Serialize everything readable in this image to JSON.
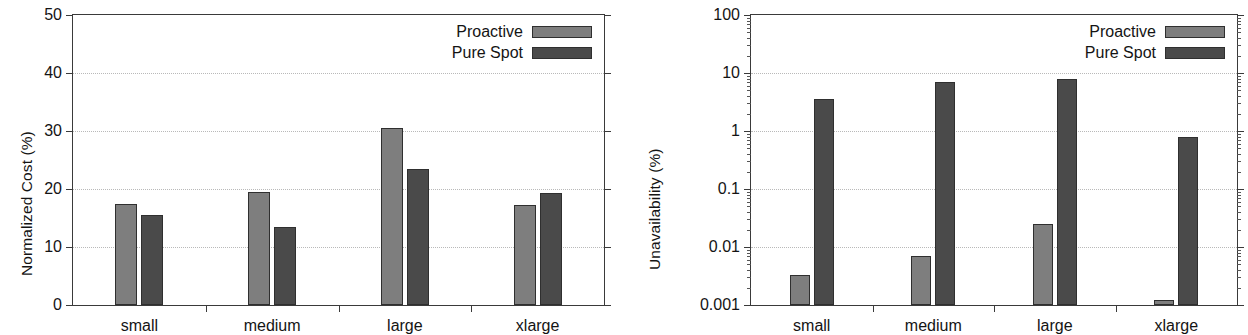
{
  "colors": {
    "proactive": "#7e7e7e",
    "pure_spot": "#4a4a4a",
    "axis": "#3a3a3a",
    "grid": "#b9b9b9",
    "background": "#ffffff"
  },
  "legend": {
    "proactive_label": "Proactive",
    "pure_spot_label": "Pure Spot"
  },
  "chart_data": [
    {
      "id": "normalized-cost",
      "type": "bar",
      "title": "",
      "xlabel": "",
      "ylabel": "Normalized Cost (%)",
      "categories": [
        "small",
        "medium",
        "large",
        "xlarge"
      ],
      "yscale": "linear",
      "ylim": [
        0,
        50
      ],
      "yticks": [
        0,
        10,
        20,
        30,
        40,
        50
      ],
      "ytick_labels": [
        "0",
        "10",
        "20",
        "30",
        "40",
        "50"
      ],
      "grid": true,
      "legend_position": "top-right",
      "series": [
        {
          "name": "Proactive",
          "color": "#7e7e7e",
          "values": [
            17.5,
            19.5,
            30.5,
            17.2
          ]
        },
        {
          "name": "Pure Spot",
          "color": "#4a4a4a",
          "values": [
            15.6,
            13.4,
            23.5,
            19.3
          ]
        }
      ]
    },
    {
      "id": "unavailability",
      "type": "bar",
      "title": "",
      "xlabel": "",
      "ylabel": "Unavailability (%)",
      "categories": [
        "small",
        "medium",
        "large",
        "xlarge"
      ],
      "yscale": "log",
      "ylim": [
        0.001,
        100
      ],
      "yticks": [
        0.001,
        0.01,
        0.1,
        1,
        10,
        100
      ],
      "ytick_labels": [
        "0.001",
        "0.01",
        "0.1",
        "1",
        "10",
        "100"
      ],
      "grid": true,
      "legend_position": "top-right",
      "series": [
        {
          "name": "Proactive",
          "color": "#7e7e7e",
          "values": [
            0.0033,
            0.007,
            0.025,
            0.0012
          ]
        },
        {
          "name": "Pure Spot",
          "color": "#4a4a4a",
          "values": [
            3.6,
            6.9,
            8.0,
            0.8
          ]
        }
      ]
    }
  ]
}
